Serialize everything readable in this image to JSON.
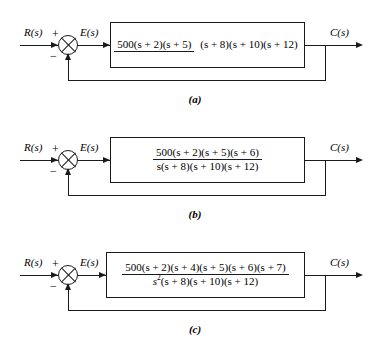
{
  "figure": {
    "type": "control-system-block-diagrams",
    "count": 3
  },
  "labels": {
    "input": "R(s)",
    "error": "E(s)",
    "output": "C(s)",
    "plus": "+",
    "minus": "−"
  },
  "diagrams": [
    {
      "id": "a",
      "caption": "(a)",
      "input_label": "R(s)",
      "error_label": "E(s)",
      "output_label": "C(s)",
      "summing_plus": "+",
      "summing_minus": "−",
      "transfer_function": {
        "numerator": "500(s + 2)(s + 5)",
        "denominator": "(s + 8)(s + 10)(s + 12)",
        "numerator_gain": "500",
        "numerator_zeros": [
          "s + 2",
          "s + 5"
        ],
        "denominator_poles": [
          "s + 8",
          "s + 10",
          "s + 12"
        ],
        "integrator_power": 0
      }
    },
    {
      "id": "b",
      "caption": "(b)",
      "input_label": "R(s)",
      "error_label": "E(s)",
      "output_label": "C(s)",
      "summing_plus": "+",
      "summing_minus": "−",
      "transfer_function": {
        "numerator": "500(s + 2)(s + 5)(s + 6)",
        "denominator": "s(s + 8)(s + 10)(s + 12)",
        "numerator_gain": "500",
        "numerator_zeros": [
          "s + 2",
          "s + 5",
          "s + 6"
        ],
        "denominator_poles": [
          "s",
          "s + 8",
          "s + 10",
          "s + 12"
        ],
        "integrator_power": 1
      }
    },
    {
      "id": "c",
      "caption": "(c)",
      "input_label": "R(s)",
      "error_label": "E(s)",
      "output_label": "C(s)",
      "summing_plus": "+",
      "summing_minus": "−",
      "transfer_function": {
        "numerator": "500(s + 2)(s + 4)(s + 5)(s + 6)(s + 7)",
        "denominator_base": "s",
        "denominator_exponent": "2",
        "denominator_rest": "(s + 8)(s + 10)(s + 12)",
        "numerator_gain": "500",
        "numerator_zeros": [
          "s + 2",
          "s + 4",
          "s + 5",
          "s + 6",
          "s + 7"
        ],
        "denominator_poles": [
          "s²",
          "s + 8",
          "s + 10",
          "s + 12"
        ],
        "integrator_power": 2
      }
    }
  ],
  "colors": {
    "line": "#1a1a1a",
    "background": "#ffffff",
    "text": "#000000"
  }
}
